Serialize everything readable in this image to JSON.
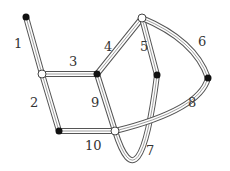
{
  "diagram": {
    "type": "graph-traversal",
    "nodes": [
      {
        "id": "A",
        "style": "black"
      },
      {
        "id": "B",
        "style": "white"
      },
      {
        "id": "C",
        "style": "black"
      },
      {
        "id": "D",
        "style": "white"
      },
      {
        "id": "E",
        "style": "black"
      },
      {
        "id": "F",
        "style": "black"
      },
      {
        "id": "G",
        "style": "black"
      },
      {
        "id": "H",
        "style": "white"
      }
    ],
    "edges": [
      {
        "label": "1",
        "from": "A",
        "to": "B"
      },
      {
        "label": "2",
        "from": "B",
        "to": "G"
      },
      {
        "label": "3",
        "from": "B",
        "to": "C"
      },
      {
        "label": "4",
        "from": "C",
        "to": "D"
      },
      {
        "label": "5",
        "from": "D",
        "to": "E"
      },
      {
        "label": "6",
        "from": "D",
        "to": "F"
      },
      {
        "label": "7",
        "from": "E",
        "to": "H"
      },
      {
        "label": "8",
        "from": "F",
        "to": "H"
      },
      {
        "label": "9",
        "from": "C",
        "to": "H"
      },
      {
        "label": "10",
        "from": "G",
        "to": "H"
      }
    ]
  }
}
